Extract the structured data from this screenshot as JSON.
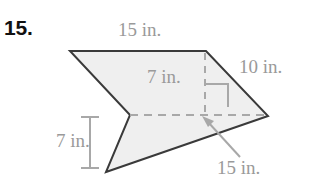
{
  "figure": {
    "problem_number": "15.",
    "shape": "concave-arrow-pentagon",
    "fill_color": "#efefef",
    "stroke_color": "#3a3a3a",
    "dim_color": "#9a9a9a",
    "background_color": "#ffffff",
    "unit": "in.",
    "labels": {
      "top": "15 in.",
      "right": "10 in.",
      "inner_height": "7 in.",
      "left_height": "7 in.",
      "bottom": "15 in."
    },
    "vertices": [
      {
        "name": "top-left",
        "x": 70,
        "y": 51
      },
      {
        "name": "top-right",
        "x": 206,
        "y": 51
      },
      {
        "name": "right-point",
        "x": 268,
        "y": 116
      },
      {
        "name": "bottom-left",
        "x": 106,
        "y": 172
      },
      {
        "name": "notch",
        "x": 130,
        "y": 115
      }
    ],
    "measurements": [
      {
        "name": "top-edge",
        "value": 15,
        "unit": "in.",
        "label": "15 in."
      },
      {
        "name": "right-edge",
        "value": 10,
        "unit": "in.",
        "label": "10 in."
      },
      {
        "name": "inner-height",
        "value": 7,
        "unit": "in.",
        "label": "7 in."
      },
      {
        "name": "left-height",
        "value": 7,
        "unit": "in.",
        "label": "7 in."
      },
      {
        "name": "bottom-edge",
        "value": 15,
        "unit": "in.",
        "label": "15 in."
      }
    ],
    "annotations": {
      "right_angle_marker": true,
      "dashed_horizontal_axis": true,
      "dashed_vertical_height": true,
      "leader_arrow_to_bottom_edge": true,
      "left_dimension_ticks": true
    }
  }
}
